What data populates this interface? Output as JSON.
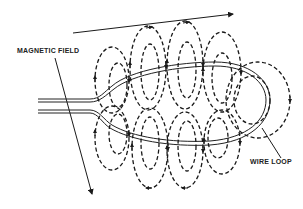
{
  "diagram": {
    "labels": {
      "magnetic_field": "MAGNETIC FIELD",
      "wire_loop": "WIRE LOOP"
    },
    "colors": {
      "ink": "#1a1a1a",
      "background": "#ffffff"
    },
    "arrows": {
      "top_direction": "right",
      "field_label_pointer": "down-right"
    }
  }
}
